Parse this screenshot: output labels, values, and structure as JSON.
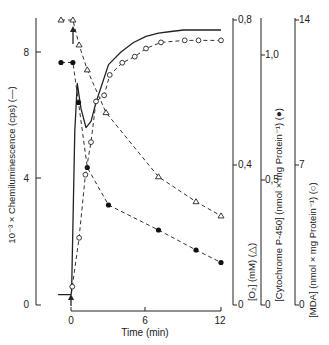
{
  "chart_data": {
    "type": "line",
    "title": "",
    "xlabel": "Time (min)",
    "x_ticks": [
      "0",
      "6",
      "12"
    ],
    "xlim": [
      -1,
      12
    ],
    "axes": [
      {
        "id": "cl",
        "label": "10⁻³ × Chemiluminescence (cps) (—)",
        "ticks": [
          "0",
          "4",
          "8"
        ],
        "ylim": [
          0,
          9
        ]
      },
      {
        "id": "o2",
        "label": "[O₂] (mM) (△)",
        "ticks": [
          "0",
          "0,4",
          "0,8"
        ],
        "ylim": [
          0,
          0.8
        ]
      },
      {
        "id": "cyt",
        "label": "[Cytochrome P-450] (nmol × mg Protein⁻¹) (●)",
        "ticks": [
          "0",
          "0,5",
          "1,0"
        ],
        "ylim": [
          0,
          1.0
        ]
      },
      {
        "id": "mda",
        "label": "[MDA] (nmol × mg Protein⁻¹) (○)",
        "ticks": [
          "0",
          "7",
          "14"
        ],
        "ylim": [
          0,
          14
        ]
      }
    ],
    "series": [
      {
        "name": "Chemiluminescence",
        "axis": "cl",
        "style": "solid-line",
        "x": [
          -1,
          0,
          0.05,
          0.3,
          0.5,
          0.8,
          1.2,
          1.6,
          2.0,
          2.5,
          3.0,
          4.0,
          5.0,
          6.0,
          7.0,
          8.0,
          9.0,
          10.0,
          11.0,
          12.0
        ],
        "values": [
          0.3,
          0.3,
          0.4,
          5.5,
          7.0,
          6.2,
          5.6,
          5.8,
          6.4,
          7.0,
          7.6,
          8.0,
          8.3,
          8.5,
          8.6,
          8.65,
          8.7,
          8.7,
          8.7,
          8.7
        ]
      },
      {
        "name": "O2",
        "axis": "o2",
        "marker": "open-triangle",
        "x": [
          -0.8,
          0.15,
          0.65,
          1.3,
          2.8,
          7.0,
          10.0,
          12.0
        ],
        "values": [
          0.8,
          0.8,
          0.73,
          0.66,
          0.54,
          0.36,
          0.29,
          0.25
        ]
      },
      {
        "name": "Cytochrome P-450",
        "axis": "cyt",
        "marker": "filled-circle",
        "x": [
          -0.8,
          0.15,
          0.6,
          1.3,
          3.0,
          7.0,
          10.0,
          12.0
        ],
        "values": [
          0.97,
          0.97,
          0.81,
          0.55,
          0.4,
          0.3,
          0.22,
          0.17
        ]
      },
      {
        "name": "MDA",
        "axis": "mda",
        "marker": "open-circle",
        "x": [
          0.1,
          0.65,
          1.15,
          1.6,
          2.0,
          2.65,
          3.1,
          4.1,
          5.1,
          6.0,
          7.2,
          9.1,
          10.2,
          12.0
        ],
        "values": [
          0.9,
          3.3,
          6.4,
          8.0,
          10.0,
          10.3,
          11.3,
          11.9,
          12.2,
          12.6,
          12.9,
          13.0,
          13.0,
          13.0
        ]
      }
    ],
    "annotations": [
      "arrow at t=0 (addition)"
    ],
    "grid": false,
    "legend": "none (symbols defined in axis labels)"
  },
  "labels": {
    "xlabel": "Time (min)",
    "x0": "0",
    "x6": "6",
    "x12": "12",
    "cl_label": "10⁻³ × Chemiluminescence (cps) (—)",
    "cl_t0": "0",
    "cl_t4": "4",
    "cl_t8": "8",
    "o2_label": "[O₂] (mM) (△)",
    "o2_t0": "0",
    "o2_t1": "0,4",
    "o2_t2": "0,8",
    "cyt_label": "[Cytochrome P-450] (nmol × mg Protein⁻¹) (●)",
    "cyt_t0": "0",
    "cyt_t1": "0,5",
    "cyt_t2": "1,0",
    "mda_label": "[MDA] (nmol × mg Protein⁻¹) (○)",
    "mda_t0": "0",
    "mda_t1": "7",
    "mda_t2": "14"
  }
}
